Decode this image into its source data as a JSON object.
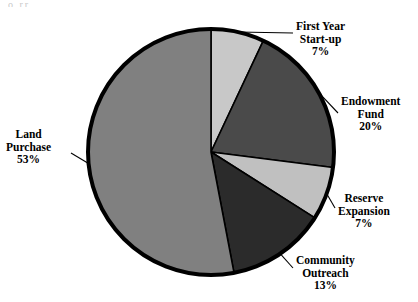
{
  "figure": {
    "top_edge_artifact": "o      rr"
  },
  "chart_data": {
    "type": "pie",
    "title": "",
    "subtitle": "",
    "xlabel": "",
    "ylabel": "",
    "legend_position": "callout-labels",
    "grid": false,
    "units": "percent",
    "total": 100,
    "start_angle_deg": 0,
    "direction": "clockwise",
    "categories": [
      "First Year Start-up",
      "Endowment Fund",
      "Reserve Expansion",
      "Community Outreach",
      "Land Purchase"
    ],
    "values": [
      7,
      20,
      7,
      13,
      53
    ],
    "colors": [
      "#c8c8c8",
      "#4a4a4a",
      "#c0c0c0",
      "#2b2b2b",
      "#808080"
    ],
    "slices": [
      {
        "name": "First Year Start-up",
        "label_line1": "First Year",
        "label_line2": "Start-up",
        "value": 7,
        "value_label": "7%",
        "color": "#c8c8c8",
        "start_deg": 0,
        "end_deg": 25.2
      },
      {
        "name": "Endowment Fund",
        "label_line1": "Endowment",
        "label_line2": "Fund",
        "value": 20,
        "value_label": "20%",
        "color": "#4a4a4a",
        "start_deg": 25.2,
        "end_deg": 97.2
      },
      {
        "name": "Reserve Expansion",
        "label_line1": "Reserve",
        "label_line2": "Expansion",
        "value": 7,
        "value_label": "7%",
        "color": "#c0c0c0",
        "start_deg": 97.2,
        "end_deg": 122.4
      },
      {
        "name": "Community Outreach",
        "label_line1": "Community",
        "label_line2": "Outreach",
        "value": 13,
        "value_label": "13%",
        "color": "#2b2b2b",
        "start_deg": 122.4,
        "end_deg": 169.2
      },
      {
        "name": "Land Purchase",
        "label_line1": "Land",
        "label_line2": "Purchase",
        "value": 53,
        "value_label": "53%",
        "color": "#808080",
        "start_deg": 169.2,
        "end_deg": 360
      }
    ],
    "geometry": {
      "center_x": 211,
      "center_y": 152,
      "radius": 123,
      "outline_color": "#000000",
      "outline_width": 4,
      "divider_color": "#000000",
      "divider_width": 1.6
    }
  }
}
